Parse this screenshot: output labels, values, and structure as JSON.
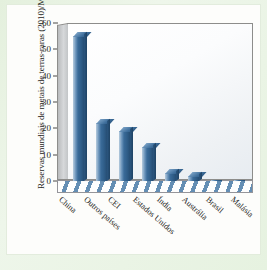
{
  "chart_data": {
    "type": "bar",
    "title": "",
    "xlabel": "",
    "ylabel": "Reservas mundiais de metais de terras-raras (2010)/Mt",
    "categories": [
      "China",
      "Outros países",
      "CEI",
      "Estados Unidos",
      "Índia",
      "Austrália",
      "Brasil",
      "Malásia"
    ],
    "values": [
      55,
      22,
      19,
      13,
      3,
      2,
      0.05,
      0.03
    ],
    "unit": "Mt",
    "ylim": [
      0,
      60
    ],
    "yticks": [
      0,
      10,
      20,
      30,
      40,
      50,
      60
    ],
    "grid": false,
    "legend": false,
    "series": [
      {
        "name": "Reservas mundiais de metais de terras-raras (2010)",
        "values": [
          55,
          22,
          19,
          13,
          3,
          2,
          0.05,
          0.03
        ]
      }
    ],
    "colors": {
      "bar": "#3a6b99",
      "bar_light": "#9db9d2",
      "bar_dark": "#264e74",
      "axis": "#4b4a48",
      "plot_background": "#eef1f4",
      "page_background": "#e8f3e2"
    }
  }
}
